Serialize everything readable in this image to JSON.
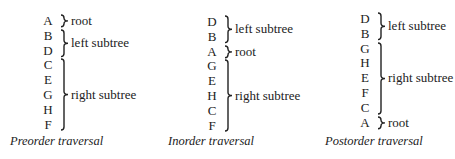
{
  "traversals": [
    {
      "caption": "Preorder traversal",
      "sequence": [
        "A",
        "B",
        "D",
        "C",
        "E",
        "G",
        "H",
        "F"
      ],
      "groups": [
        {
          "label": "root",
          "from": 0,
          "to": 0
        },
        {
          "label": "left subtree",
          "from": 1,
          "to": 2
        },
        {
          "label": "right subtree",
          "from": 3,
          "to": 7
        }
      ]
    },
    {
      "caption": "Inorder traversal",
      "sequence": [
        "D",
        "B",
        "A",
        "G",
        "E",
        "H",
        "C",
        "F"
      ],
      "groups": [
        {
          "label": "left subtree",
          "from": 0,
          "to": 1
        },
        {
          "label": "root",
          "from": 2,
          "to": 2
        },
        {
          "label": "right subtree",
          "from": 3,
          "to": 7
        }
      ]
    },
    {
      "caption": "Postorder traversal",
      "sequence": [
        "D",
        "B",
        "G",
        "H",
        "E",
        "F",
        "C",
        "A"
      ],
      "groups": [
        {
          "label": "left subtree",
          "from": 0,
          "to": 1
        },
        {
          "label": "right subtree",
          "from": 2,
          "to": 6
        },
        {
          "label": "root",
          "from": 7,
          "to": 7
        }
      ]
    }
  ]
}
